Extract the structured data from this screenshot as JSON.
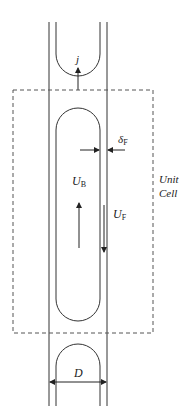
{
  "diagram": {
    "type": "slug-flow-unit-cell",
    "labels": {
      "j": "j",
      "delta_f": "δ",
      "delta_f_sub": "F",
      "u_b": "U",
      "u_b_sub": "B",
      "u_f": "U",
      "u_f_sub": "F",
      "unit": "Unit",
      "cell": "Cell",
      "d": "D"
    },
    "colors": {
      "line": "#333333",
      "dash": "#555555",
      "background": "#ffffff"
    }
  }
}
